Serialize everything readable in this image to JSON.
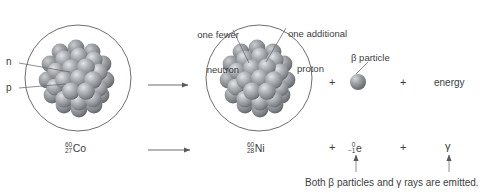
{
  "figure": {
    "background_color": "#ffffff",
    "line_color": "#4a4a4a",
    "text_color": "#3d3d3d",
    "nucleon_color": "#8f9195",
    "nucleon_highlight": "#d8dadd",
    "nucleon_shadow": "#5d6064"
  },
  "callouts": {
    "one_fewer_neutron_line1": "one fewer",
    "one_fewer_neutron_line2": "neutron",
    "one_additional_proton_line1": "one additional",
    "one_additional_proton_line2": "proton",
    "beta_particle": "β particle"
  },
  "nucleus_labels": {
    "neutron": "n",
    "proton": "p"
  },
  "top_equation": {
    "plus_1": "+",
    "plus_2": "+",
    "energy": "energy"
  },
  "bottom_equation": {
    "reactant": {
      "mass_number": "60",
      "atomic_number": "27",
      "symbol": "Co"
    },
    "product": {
      "mass_number": "60",
      "atomic_number": "28",
      "symbol": "Ni"
    },
    "plus_1": "+",
    "beta": {
      "mass_number": "0",
      "atomic_number": "−1",
      "symbol": "e"
    },
    "plus_2": "+",
    "gamma": "γ"
  },
  "footnote": {
    "text": "Both β particles and γ rays are emitted."
  }
}
